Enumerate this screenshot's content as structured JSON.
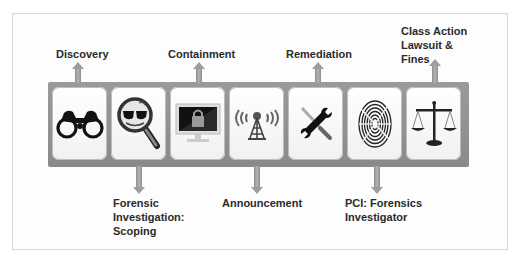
{
  "diagram": {
    "stages_top": [
      {
        "id": "discovery",
        "label": "Discovery",
        "icon": "binoculars-icon"
      },
      {
        "id": "containment",
        "label": "Containment",
        "icon": "locked-monitor-icon"
      },
      {
        "id": "remediation",
        "label": "Remediation",
        "icon": "wrench-screwdriver-icon"
      },
      {
        "id": "class-action",
        "label": "Class Action\nLawsuit &\nFines",
        "icon": "scales-of-justice-icon"
      }
    ],
    "stages_bottom": [
      {
        "id": "forensic-scoping",
        "label": "Forensic\nInvestigation:\nScoping",
        "icon": "magnifier-sunglasses-icon"
      },
      {
        "id": "announcement",
        "label": "Announcement",
        "icon": "broadcast-tower-icon"
      },
      {
        "id": "pci-forensics",
        "label": "PCI: Forensics\nInvestigator",
        "icon": "fingerprint-icon"
      }
    ],
    "sequence": [
      "Discovery",
      "Forensic Investigation: Scoping",
      "Containment",
      "Announcement",
      "Remediation",
      "PCI: Forensics Investigator",
      "Class Action Lawsuit & Fines"
    ],
    "colors": {
      "band": "#8f8f8f",
      "arrow": "#9d9d9d",
      "card": "#ffffff",
      "text": "#2b2b2b",
      "frame": "#d6d6d6"
    }
  }
}
